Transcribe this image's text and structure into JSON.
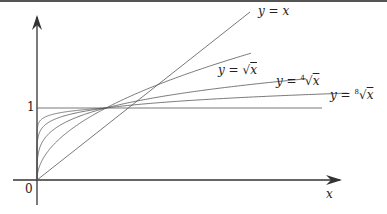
{
  "chart_data": {
    "type": "line",
    "title": "",
    "xlabel": "x",
    "ylabel": "",
    "tick_labels": {
      "origin": "0",
      "y_one": "1"
    },
    "series": [
      {
        "name": "y = x",
        "label_plain": "y = x",
        "exponent": 1
      },
      {
        "name": "y = sqrt(x)",
        "label_plain": "y = √x",
        "exponent": 0.5
      },
      {
        "name": "y = 4th-root(x)",
        "label_plain": "y = ⁴√x",
        "exponent": 0.25
      },
      {
        "name": "y = 8th-root(x)",
        "label_plain": "y = ⁸√x",
        "exponent": 0.125
      }
    ],
    "unlabeled_curves_exponents": [
      0.5,
      0.25,
      0.125,
      0.0625
    ],
    "reference_line": {
      "y": 1
    },
    "intersection_point": [
      1,
      1
    ],
    "grid": false
  },
  "labels": {
    "y_eq_x": {
      "y": "y",
      "eq": "=",
      "rhs": "x"
    },
    "y_eq_sqrt": {
      "y": "y",
      "eq": "=",
      "radical": "√",
      "index": "",
      "rhs": "x"
    },
    "y_eq_root4": {
      "y": "y",
      "eq": "=",
      "radical": "√",
      "index": "4",
      "rhs": "x"
    },
    "y_eq_root8": {
      "y": "y",
      "eq": "=",
      "radical": "√",
      "index": "8",
      "rhs": "x"
    },
    "x_axis": "x",
    "origin": "0",
    "one": "1"
  }
}
